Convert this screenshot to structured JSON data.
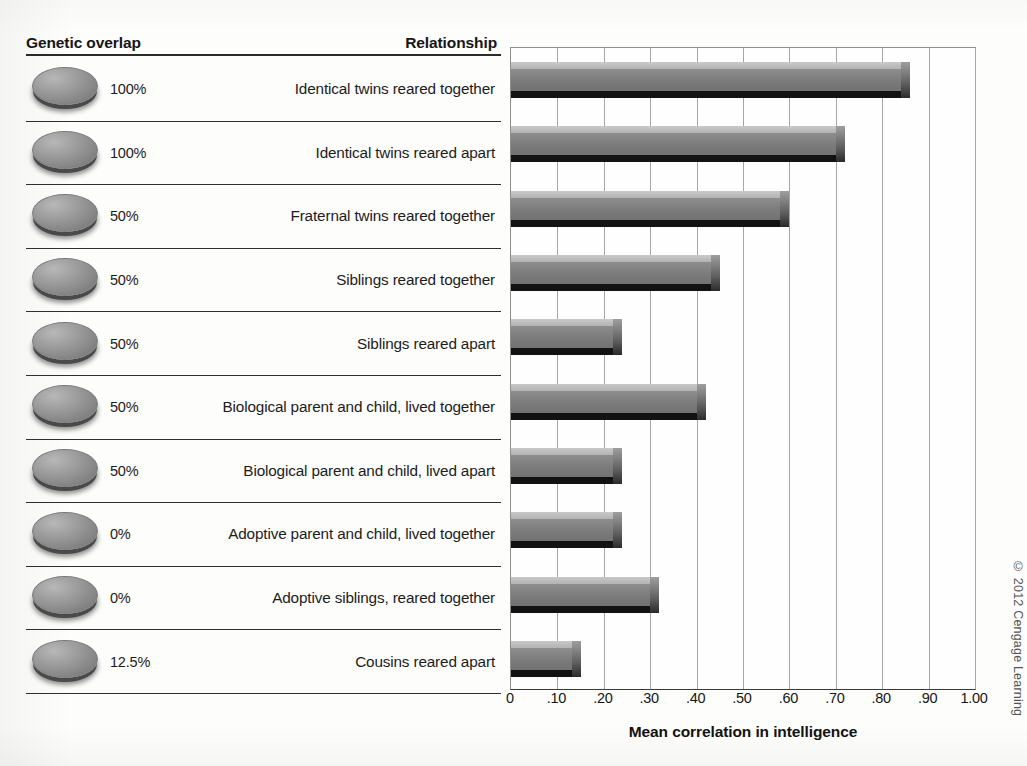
{
  "figure": {
    "headers": {
      "genetic_overlap": "Genetic overlap",
      "relationship": "Relationship"
    },
    "copyright": "© 2012 Cengage Learning"
  },
  "chart_data": {
    "type": "bar",
    "orientation": "horizontal",
    "title": "",
    "xlabel": "Mean correlation in intelligence",
    "ylabel": "",
    "xlim": [
      0,
      1.0
    ],
    "xticks": [
      0,
      0.1,
      0.2,
      0.3,
      0.4,
      0.5,
      0.6,
      0.7,
      0.8,
      0.9,
      1.0
    ],
    "xticklabels": [
      "0",
      ".10",
      ".20",
      ".30",
      ".40",
      ".50",
      ".60",
      ".70",
      ".80",
      ".90",
      "1.00"
    ],
    "grid": true,
    "legend": false,
    "categories": [
      "Identical twins reared together",
      "Identical twins reared apart",
      "Fraternal twins reared together",
      "Siblings reared together",
      "Siblings reared apart",
      "Biological parent and child, lived together",
      "Biological parent and child, lived apart",
      "Adoptive parent and child, lived together",
      "Adoptive siblings, reared together",
      "Cousins reared apart"
    ],
    "values": [
      0.86,
      0.72,
      0.6,
      0.45,
      0.24,
      0.42,
      0.24,
      0.24,
      0.32,
      0.15
    ],
    "genetic_overlap": [
      "100%",
      "100%",
      "50%",
      "50%",
      "50%",
      "50%",
      "50%",
      "0%",
      "0%",
      "12.5%"
    ]
  },
  "rows": [
    {
      "overlap": "100%",
      "relationship": "Identical twins reared together",
      "value": 0.86
    },
    {
      "overlap": "100%",
      "relationship": "Identical twins reared apart",
      "value": 0.72
    },
    {
      "overlap": "50%",
      "relationship": "Fraternal twins reared together",
      "value": 0.6
    },
    {
      "overlap": "50%",
      "relationship": "Siblings reared together",
      "value": 0.45
    },
    {
      "overlap": "50%",
      "relationship": "Siblings reared apart",
      "value": 0.24
    },
    {
      "overlap": "50%",
      "relationship": "Biological parent and child, lived together",
      "value": 0.42
    },
    {
      "overlap": "50%",
      "relationship": "Biological parent and child, lived apart",
      "value": 0.24
    },
    {
      "overlap": "0%",
      "relationship": "Adoptive parent and child, lived together",
      "value": 0.24
    },
    {
      "overlap": "0%",
      "relationship": "Adoptive siblings, reared together",
      "value": 0.32
    },
    {
      "overlap": "12.5%",
      "relationship": "Cousins reared apart",
      "value": 0.15
    }
  ],
  "colors": {
    "bar_body": "#7b7b7b",
    "bar_top": "#b2b2b2",
    "bar_shadow": "#121212",
    "gridline": "#a6a6a6",
    "text": "#1b1b1b"
  }
}
